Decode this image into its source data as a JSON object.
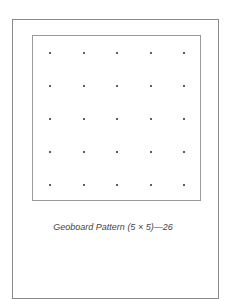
{
  "figure": {
    "caption": "Geoboard Pattern (5 × 5)—26",
    "grid": {
      "rows": 5,
      "columns": 5
    },
    "peg_color": "#2a2a2a",
    "border_color": "#8a8a8a"
  }
}
